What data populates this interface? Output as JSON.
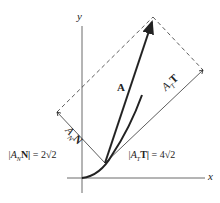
{
  "axes": {
    "x_label": "x",
    "y_label": "y"
  },
  "vectors": {
    "A": "A",
    "tangential_prefix": "A",
    "tangential_sub": "T",
    "tangential_unit": "T",
    "normal_prefix": "A",
    "normal_sub": "N",
    "normal_unit": "N"
  },
  "equations": {
    "normal": "|AₙN| = 2√2",
    "normal_parts": {
      "open": "|A",
      "sub": "N",
      "unit": "N|",
      "rhs": " = 2√2"
    },
    "tangential_parts": {
      "open": "|A",
      "sub": "T",
      "unit": "T|",
      "rhs": " = 4√2"
    }
  },
  "colors": {
    "ink": "#222222",
    "paper": "#ffffff"
  }
}
